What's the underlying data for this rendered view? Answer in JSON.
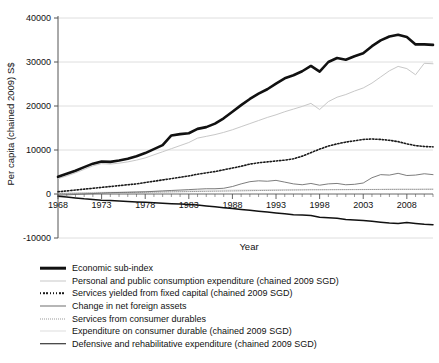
{
  "figure": {
    "background": "#ffffff",
    "cropped_title_fragment": ""
  },
  "axes": {
    "xlabel": "Year",
    "ylabel": "Per capita (chained 2009) S$",
    "ytick_labels": [
      "40000",
      "30000",
      "20000",
      "10000",
      "0",
      "-10000"
    ],
    "ytick_values": [
      40000,
      30000,
      20000,
      10000,
      0,
      -10000
    ],
    "xtick_labels": [
      "1968",
      "1973",
      "1978",
      "1983",
      "1988",
      "1993",
      "1998",
      "2003",
      "2008"
    ],
    "xtick_values": [
      1968,
      1973,
      1978,
      1983,
      1988,
      1993,
      1998,
      2003,
      2008
    ],
    "grid": "horizontal",
    "xlim": [
      1968,
      2011
    ],
    "ylim": [
      -10000,
      40000
    ]
  },
  "legend": {
    "position": "below-axes",
    "items": [
      {
        "label": "Economic sub-index",
        "style": "solid",
        "width": 2.6,
        "color": "#111111"
      },
      {
        "label": "Personal and public consumption expenditure (chained 2009 SGD)",
        "style": "solid",
        "width": 1.0,
        "color": "#c8c8c8"
      },
      {
        "label": "Services yielded from fixed capital (chained 2009 SGD)",
        "style": "dotted",
        "width": 1.6,
        "color": "#1a1a1a"
      },
      {
        "label": "Change in net foreign assets",
        "style": "solid",
        "width": 0.9,
        "color": "#6e6e6e"
      },
      {
        "label": "Services from consumer durables",
        "style": "dotted",
        "width": 1.0,
        "color": "#9a9a9a"
      },
      {
        "label": "Expenditure on consumer durable (chained 2009 SGD)",
        "style": "solid",
        "width": 0.8,
        "color": "#dedede"
      },
      {
        "label": "Defensive and rehabilitative expenditure (chained 2009 SGD)",
        "style": "solid",
        "width": 1.5,
        "color": "#111111"
      }
    ]
  },
  "chart_data": {
    "type": "line",
    "title": "",
    "xlabel": "Year",
    "ylabel": "Per capita (chained 2009) S$",
    "xlim": [
      1968,
      2011
    ],
    "ylim": [
      -10000,
      40000
    ],
    "grid": true,
    "legend_position": "below",
    "x": [
      1968,
      1969,
      1970,
      1971,
      1972,
      1973,
      1974,
      1975,
      1976,
      1977,
      1978,
      1979,
      1980,
      1981,
      1982,
      1983,
      1984,
      1985,
      1986,
      1987,
      1988,
      1989,
      1990,
      1991,
      1992,
      1993,
      1994,
      1995,
      1996,
      1997,
      1998,
      1999,
      2000,
      2001,
      2002,
      2003,
      2004,
      2005,
      2006,
      2007,
      2008,
      2009,
      2010,
      2011
    ],
    "series": [
      {
        "name": "Economic sub-index",
        "color": "#111111",
        "style": "solid",
        "width": 2.6,
        "values": [
          3900,
          4600,
          5300,
          6100,
          6900,
          7400,
          7300,
          7600,
          8000,
          8600,
          9300,
          10200,
          11100,
          13300,
          13600,
          13800,
          14800,
          15200,
          16000,
          17200,
          18700,
          20200,
          21600,
          22800,
          23800,
          25100,
          26300,
          27000,
          27900,
          29100,
          27800,
          30000,
          30900,
          30500,
          31300,
          32000,
          33600,
          34900,
          35800,
          36200,
          35700,
          34000,
          34000,
          33900
        ]
      },
      {
        "name": "Personal and public consumption expenditure (chained 2009 SGD)",
        "color": "#c8c8c8",
        "style": "solid",
        "width": 1.0,
        "values": [
          3500,
          4100,
          4800,
          5600,
          6400,
          6900,
          6800,
          7000,
          7300,
          7700,
          8200,
          8900,
          9600,
          10300,
          11000,
          11700,
          12700,
          13100,
          13500,
          14000,
          14600,
          15300,
          16000,
          16700,
          17400,
          18000,
          18700,
          19300,
          19900,
          20600,
          19200,
          21000,
          22000,
          22600,
          23400,
          24100,
          25200,
          26600,
          28000,
          29000,
          28500,
          27100,
          29700,
          29600
        ]
      },
      {
        "name": "Services yielded from fixed capital (chained 2009 SGD)",
        "color": "#1a1a1a",
        "style": "dotted",
        "width": 1.6,
        "values": [
          500,
          700,
          900,
          1100,
          1300,
          1500,
          1700,
          1900,
          2100,
          2300,
          2600,
          2900,
          3200,
          3500,
          3800,
          4100,
          4500,
          4800,
          5100,
          5500,
          5900,
          6300,
          6800,
          7100,
          7300,
          7500,
          7700,
          8000,
          8600,
          9400,
          10200,
          10900,
          11400,
          11800,
          12100,
          12400,
          12500,
          12400,
          12200,
          11900,
          11400,
          11000,
          10800,
          10700
        ]
      },
      {
        "name": "Change in net foreign assets",
        "color": "#6e6e6e",
        "style": "solid",
        "width": 0.9,
        "values": [
          -300,
          -200,
          -100,
          0,
          100,
          200,
          300,
          350,
          400,
          450,
          500,
          600,
          700,
          800,
          900,
          1000,
          1100,
          1200,
          1200,
          1300,
          1700,
          2300,
          2800,
          3000,
          2900,
          3100,
          2700,
          2300,
          2100,
          2400,
          2000,
          2300,
          2400,
          2100,
          2200,
          2500,
          3700,
          4400,
          4300,
          4700,
          4200,
          4300,
          4600,
          4400
        ]
      },
      {
        "name": "Services from consumer durables",
        "color": "#9a9a9a",
        "style": "dotted",
        "width": 1.0,
        "values": [
          100,
          130,
          160,
          190,
          220,
          250,
          280,
          310,
          340,
          370,
          400,
          430,
          460,
          490,
          520,
          550,
          580,
          610,
          640,
          670,
          700,
          730,
          760,
          790,
          820,
          850,
          880,
          900,
          920,
          950,
          960,
          970,
          980,
          990,
          1000,
          1010,
          1020,
          1030,
          1040,
          1050,
          1060,
          1060,
          1070,
          1080
        ]
      },
      {
        "name": "Expenditure on consumer durable (chained 2009 SGD)",
        "color": "#dedede",
        "style": "solid",
        "width": 0.8,
        "values": [
          200,
          240,
          280,
          320,
          360,
          400,
          430,
          460,
          500,
          540,
          580,
          620,
          660,
          700,
          740,
          780,
          820,
          860,
          880,
          900,
          930,
          960,
          990,
          1000,
          1000,
          1010,
          1020,
          1030,
          1030,
          1040,
          1000,
          1010,
          1030,
          1020,
          1030,
          1040,
          1060,
          1080,
          1100,
          1120,
          1100,
          1080,
          1120,
          1130
        ]
      },
      {
        "name": "Defensive and rehabilitative expenditure (chained 2009 SGD)",
        "color": "#111111",
        "style": "solid",
        "width": 1.5,
        "values": [
          -500,
          -700,
          -900,
          -1100,
          -1250,
          -1400,
          -1500,
          -1600,
          -1700,
          -1800,
          -1900,
          -2000,
          -2100,
          -2200,
          -2300,
          -2400,
          -2500,
          -2700,
          -2900,
          -3100,
          -3300,
          -3500,
          -3700,
          -3900,
          -4100,
          -4300,
          -4500,
          -4700,
          -4800,
          -4900,
          -5300,
          -5400,
          -5500,
          -5800,
          -5900,
          -6000,
          -6200,
          -6400,
          -6600,
          -6700,
          -6500,
          -6700,
          -6900,
          -7000
        ]
      }
    ]
  }
}
